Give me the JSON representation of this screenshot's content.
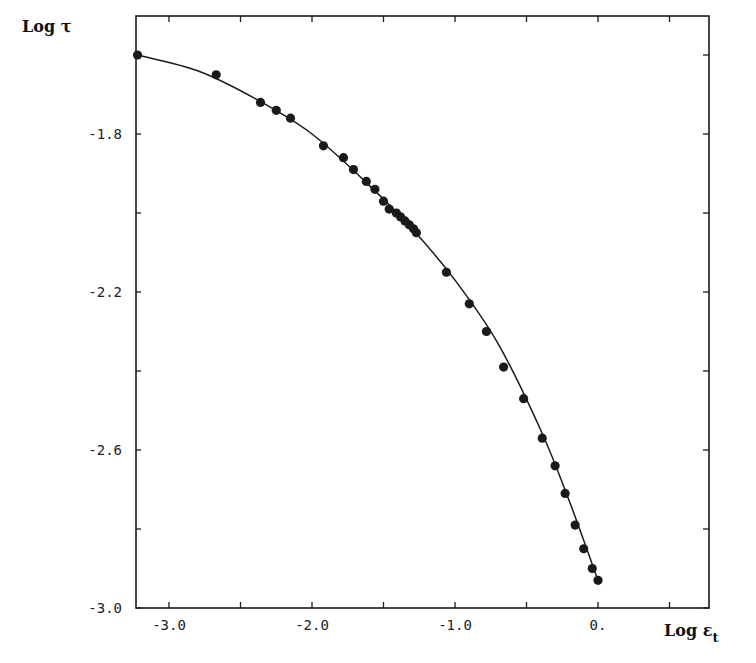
{
  "chart_data": {
    "type": "scatter",
    "title": "",
    "xlabel": "Log εt",
    "ylabel": "Log τ",
    "xlabel_main": "Log ε",
    "xlabel_sub": "t",
    "xlim": [
      -3.23,
      0.78
    ],
    "ylim": [
      -3.0,
      -1.5
    ],
    "grid": false,
    "legend": "none",
    "x_ticks": [
      -3.0,
      -2.0,
      -1.0,
      0.0
    ],
    "x_tick_labels": [
      "-3.0",
      "-2.0",
      "-1.0",
      "0."
    ],
    "x_minor_ticks": [
      -2.5,
      -1.5,
      -0.5,
      0.5
    ],
    "y_ticks": [
      -1.8,
      -2.2,
      -2.6,
      -3.0
    ],
    "y_tick_labels": [
      "-1.8",
      "-2.2",
      "-2.6",
      "-3.0"
    ],
    "y_minor_ticks": [
      -1.6,
      -2.0,
      -2.4,
      -2.8
    ],
    "series": [
      {
        "name": "measured",
        "marker": "filled-circle",
        "x": [
          -3.22,
          -2.67,
          -2.36,
          -2.25,
          -2.15,
          -1.92,
          -1.78,
          -1.71,
          -1.62,
          -1.56,
          -1.5,
          -1.46,
          -1.41,
          -1.38,
          -1.35,
          -1.32,
          -1.29,
          -1.27,
          -1.06,
          -0.9,
          -0.78,
          -0.66,
          -0.52,
          -0.39,
          -0.3,
          -0.23,
          -0.16,
          -0.1,
          -0.04,
          0.0
        ],
        "y": [
          -1.6,
          -1.65,
          -1.72,
          -1.74,
          -1.76,
          -1.83,
          -1.86,
          -1.89,
          -1.92,
          -1.94,
          -1.97,
          -1.99,
          -2.0,
          -2.01,
          -2.02,
          -2.03,
          -2.04,
          -2.05,
          -2.15,
          -2.23,
          -2.3,
          -2.39,
          -2.47,
          -2.57,
          -2.64,
          -2.71,
          -2.79,
          -2.85,
          -2.9,
          -2.93
        ]
      },
      {
        "name": "fitted-curve",
        "marker": "line",
        "x": [
          -3.22,
          -2.8,
          -2.4,
          -2.0,
          -1.6,
          -1.3,
          -1.0,
          -0.7,
          -0.4,
          -0.2,
          0.0
        ],
        "y": [
          -1.6,
          -1.64,
          -1.71,
          -1.8,
          -1.93,
          -2.04,
          -2.17,
          -2.33,
          -2.55,
          -2.73,
          -2.93
        ]
      }
    ]
  },
  "labels": {
    "y_axis_title": "Log τ",
    "x_axis_title_main": "Log ε",
    "x_axis_title_sub": "t"
  },
  "colors": {
    "ink": "#1a1a1a",
    "background": "#ffffff"
  }
}
